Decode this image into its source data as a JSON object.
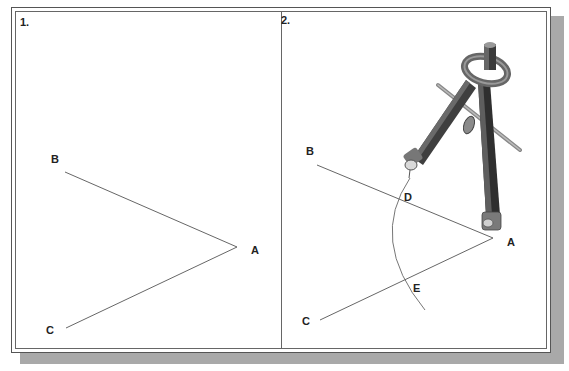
{
  "figure": {
    "panels": [
      {
        "number": "1.",
        "points": {
          "A": "A",
          "B": "B",
          "C": "C"
        },
        "description": "Angle BAC drawn with rays AB and AC"
      },
      {
        "number": "2.",
        "points": {
          "A": "A",
          "B": "B",
          "C": "C",
          "D": "D",
          "E": "E"
        },
        "description": "Compass centered at A draws an arc intersecting AB at D and AC at E"
      }
    ],
    "colors": {
      "line": "#555555",
      "frame": "#555555",
      "shadow": "#a9a9a9",
      "compass_body": "#3d3d3d",
      "compass_highlight": "#8a8a8a"
    }
  }
}
